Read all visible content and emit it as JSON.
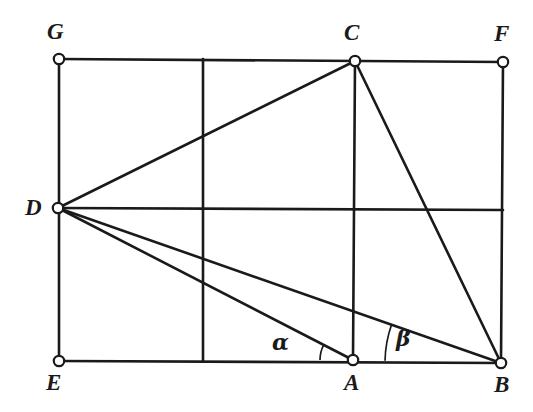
{
  "figure": {
    "kind": "geometry-diagram",
    "stroke_color": "#1a1a1a",
    "background_color": "#ffffff",
    "vertex_fill": "#ffffff",
    "points": [
      {
        "name": "G",
        "x": 59,
        "y": 59,
        "label": "G",
        "label_x": 47,
        "label_y": 20
      },
      {
        "name": "C",
        "x": 355,
        "y": 61,
        "label": "C",
        "label_x": 344,
        "label_y": 21
      },
      {
        "name": "F",
        "x": 503,
        "y": 62,
        "label": "F",
        "label_x": 494,
        "label_y": 22
      },
      {
        "name": "D",
        "x": 58,
        "y": 208,
        "label": "D",
        "label_x": 25,
        "label_y": 196
      },
      {
        "name": "E",
        "x": 59,
        "y": 361,
        "label": "E",
        "label_x": 46,
        "label_y": 371
      },
      {
        "name": "A",
        "x": 353,
        "y": 360,
        "label": "A",
        "label_x": 344,
        "label_y": 371
      },
      {
        "name": "B",
        "x": 501,
        "y": 363,
        "label": "B",
        "label_x": 494,
        "label_y": 373
      }
    ],
    "segments": [
      {
        "name": "edge-G-F",
        "from": "G",
        "to": "F",
        "width": 2.6
      },
      {
        "name": "edge-G-E",
        "from": "G",
        "to": "E",
        "width": 2.6
      },
      {
        "name": "edge-E-B",
        "from": "E",
        "to": "B",
        "width": 2.6
      },
      {
        "name": "edge-F-B",
        "from": "F",
        "to": "B",
        "width": 2.6
      },
      {
        "name": "grid-vertical-left",
        "from": [
          203,
          59
        ],
        "to": [
          203,
          361
        ],
        "width": 2.6
      },
      {
        "name": "grid-vertical-C-A",
        "from": "C",
        "to": "A",
        "width": 2.6
      },
      {
        "name": "grid-horizontal-D-F",
        "from": "D",
        "to": [
          503,
          210
        ],
        "width": 2.6
      },
      {
        "name": "diagonal-D-C",
        "from": "D",
        "to": "C",
        "width": 2.6
      },
      {
        "name": "diagonal-D-A",
        "from": "D",
        "to": "A",
        "width": 2.6
      },
      {
        "name": "diagonal-D-B",
        "from": "D",
        "to": "B",
        "width": 2.6
      },
      {
        "name": "diagonal-C-B",
        "from": "C",
        "to": "B",
        "width": 2.6
      }
    ],
    "angles": [
      {
        "name": "alpha",
        "symbol": "α",
        "vertex": "A",
        "radius": 33,
        "label_x": 272,
        "label_y": 331,
        "from_ray": "A-to-E",
        "to_ray": "A-to-D"
      },
      {
        "name": "beta",
        "symbol": "β",
        "vertex": "B",
        "radius": 116,
        "label_x": 396,
        "label_y": 327,
        "from_ray": "B-to-A",
        "to_ray": "B-to-D"
      }
    ]
  }
}
